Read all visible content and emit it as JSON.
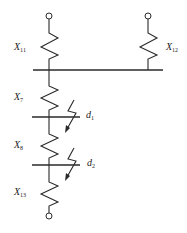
{
  "diagram": {
    "type": "circuit-reactance-diagram",
    "colors": {
      "line": "#2a2a2a",
      "text": "#222222",
      "background": "#ffffff"
    },
    "reactances": [
      {
        "id": "x11",
        "symbol": "X",
        "subscript": "11"
      },
      {
        "id": "x12",
        "symbol": "X",
        "subscript": "12"
      },
      {
        "id": "x7",
        "symbol": "X",
        "subscript": "7"
      },
      {
        "id": "x8",
        "symbol": "X",
        "subscript": "8"
      },
      {
        "id": "x13",
        "symbol": "X",
        "subscript": "13"
      }
    ],
    "fault_points": [
      {
        "id": "d1",
        "symbol": "d",
        "subscript": "1"
      },
      {
        "id": "d2",
        "symbol": "d",
        "subscript": "2"
      }
    ]
  }
}
